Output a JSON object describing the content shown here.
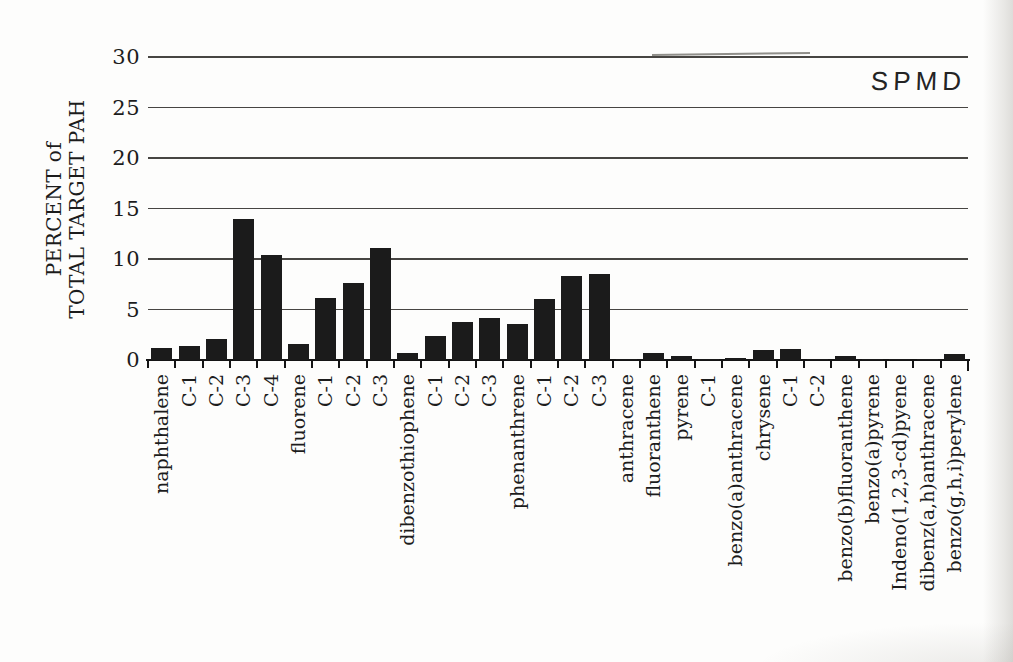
{
  "chart_data": {
    "type": "bar",
    "title": "SPMD",
    "ylabel_line1": "PERCENT of",
    "ylabel_line2": "TOTAL TARGET PAH",
    "xlabel": "",
    "ylim": [
      0,
      30
    ],
    "yticks": [
      0,
      5,
      10,
      15,
      20,
      25,
      30
    ],
    "grid": "horizontal",
    "legend_position": "top-right-corner-text",
    "bar_color": "#1b1b1b",
    "categories": [
      "naphthalene",
      "C-1",
      "C-2",
      "C-3",
      "C-4",
      "fluorene",
      "C-1",
      "C-2",
      "C-3",
      "dibenzothiophene",
      "C-1",
      "C-2",
      "C-3",
      "phenanthrene",
      "C-1",
      "C-2",
      "C-3",
      "anthracene",
      "fluoranthene",
      "pyrene",
      "C-1",
      "benzo(a)anthracene",
      "chrysene",
      "C-1",
      "C-2",
      "benzo(b)fluoranthene",
      "benzo(a)pyrene",
      "Indeno(1,2,3-cd)pyene",
      "dibenz(a,h)anthracene",
      "benzo(g,h,i)perylene"
    ],
    "values": [
      1.2,
      1.4,
      2.1,
      14.0,
      10.4,
      1.6,
      6.1,
      7.6,
      11.1,
      0.7,
      2.4,
      3.8,
      4.2,
      3.6,
      6.0,
      8.3,
      8.5,
      0.1,
      0.7,
      0.4,
      0.1,
      0.2,
      1.0,
      1.1,
      0.1,
      0.4,
      0.1,
      0.05,
      0.05,
      0.6
    ]
  }
}
